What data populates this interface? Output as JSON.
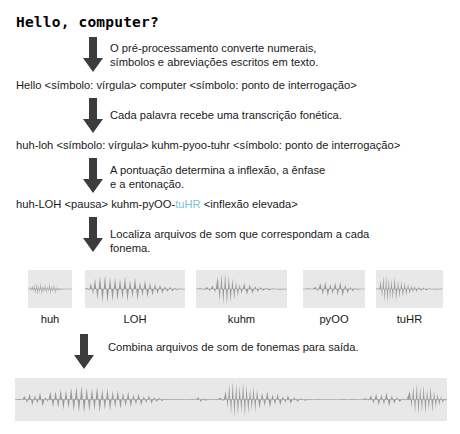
{
  "diagram": {
    "title": "Hello, computer?",
    "accent_color": "#7fc3c9",
    "waveform_fill": "#9a9a9a",
    "waveform_bg": "#e8e8e8",
    "arrow_color": "#3c3c3c",
    "steps": [
      {
        "note": "O pré-processamento converte numerais,\nsímbolos e abreviações escritos em texto.",
        "result": "Hello <símbolo: vírgula> computer <símbolo: ponto de interrogação>"
      },
      {
        "note": "Cada palavra recebe uma transcrição fonética.",
        "result": "huh-loh <símbolo: vírgula> kuhm-pyoo-tuhr <símbolo: ponto de interrogação>"
      },
      {
        "note": "A pontuação determina a inflexão, a ênfase\ne a entonação.",
        "result_parts": [
          {
            "text": "huh-LOH <pausa> kuhm-pyOO-",
            "accent": false
          },
          {
            "text": "tuHR",
            "accent": true
          },
          {
            "text": " <inflexão elevada>",
            "accent": false
          }
        ]
      },
      {
        "note": "Localiza arquivos de som que correspondam a cada fonema."
      },
      {
        "note": "Combina arquivos de som de fonemas para saída."
      }
    ],
    "phonemes": [
      {
        "label": "huh"
      },
      {
        "label": "LOH"
      },
      {
        "label": "kuhm"
      },
      {
        "label": "pyOO"
      },
      {
        "label": "tuHR"
      }
    ],
    "output_waveform_label": "combined-output-waveform"
  }
}
